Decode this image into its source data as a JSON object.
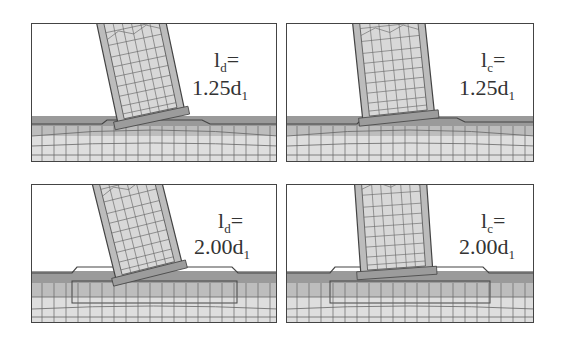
{
  "figure": {
    "panels": [
      {
        "id": "top-left",
        "var": "l",
        "sub": "d",
        "eq": "=",
        "value": "1.25d",
        "value_sub": "1",
        "tilt": -12,
        "pad": "narrow"
      },
      {
        "id": "top-right",
        "var": "l",
        "sub": "c",
        "eq": "=",
        "value": "1.25d",
        "value_sub": "1",
        "tilt": -6,
        "pad": "narrow"
      },
      {
        "id": "bottom-left",
        "var": "l",
        "sub": "d",
        "eq": "=",
        "value": "2.00d",
        "value_sub": "1",
        "tilt": -14,
        "pad": "wide"
      },
      {
        "id": "bottom-right",
        "var": "l",
        "sub": "c",
        "eq": "=",
        "value": "2.00d",
        "value_sub": "1",
        "tilt": -4,
        "pad": "wide"
      }
    ],
    "colors": {
      "border": "#444444",
      "mesh_line": "#555555",
      "fill_light": "#dcdcdc",
      "fill_mid": "#b8b8b8",
      "fill_dark": "#8a8a8a"
    }
  }
}
